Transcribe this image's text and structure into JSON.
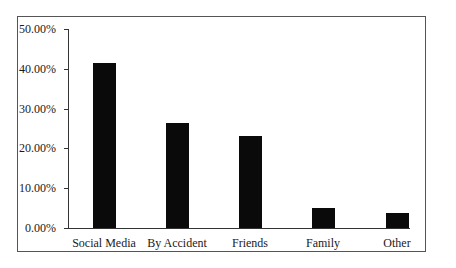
{
  "chart_data": {
    "type": "bar",
    "title": "",
    "xlabel": "",
    "ylabel": "",
    "categories": [
      "Social Media",
      "By Accident",
      "Friends",
      "Family",
      "Other"
    ],
    "values": [
      41.5,
      26.4,
      23.1,
      5.0,
      3.8
    ],
    "value_format": "percent",
    "ylim": [
      0,
      50
    ],
    "yticks": [
      "0.00%",
      "10.00%",
      "20.00%",
      "30.00%",
      "40.00%",
      "50.00%"
    ],
    "grid": false,
    "legend": null,
    "bar_color": "#0a0a0a"
  }
}
